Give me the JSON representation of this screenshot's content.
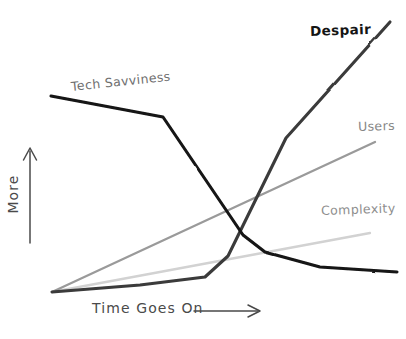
{
  "chart_data": {
    "type": "line",
    "title": "",
    "subtitle": "",
    "xlabel": "Time Goes On ⟶",
    "ylabel": "More ⟶",
    "xlabel_text": "Time Goes On",
    "ylabel_text": "More",
    "xlim": [
      0,
      100
    ],
    "ylim": [
      0,
      100
    ],
    "grid": false,
    "axis_ticks": [],
    "legend_position": "inline-end-of-line",
    "style": "hand-drawn sketch",
    "annotations": [],
    "series": [
      {
        "name": "Tech Savviness",
        "label": "Tech Savviness",
        "color": "#141414",
        "width": 3.1,
        "label_x": 71,
        "label_y": 79,
        "points": [
          [
            0,
            79
          ],
          [
            33,
            70
          ],
          [
            56,
            31
          ],
          [
            62,
            19
          ],
          [
            79,
            11
          ],
          [
            100,
            9
          ]
        ],
        "pixel_points": [
          [
            51,
            96
          ],
          [
            163,
            117
          ],
          [
            243,
            235
          ],
          [
            265,
            252
          ],
          [
            320,
            267
          ],
          [
            397,
            272
          ]
        ]
      },
      {
        "name": "Despair",
        "label": "Despair",
        "color": "#3a3a3a",
        "width": 3.1,
        "label_x": 310,
        "label_y": 23,
        "points": [
          [
            0,
            0
          ],
          [
            25,
            2
          ],
          [
            45,
            6
          ],
          [
            52,
            16
          ],
          [
            70,
            52
          ],
          [
            100,
            108
          ]
        ],
        "pixel_points": [
          [
            52,
            292
          ],
          [
            140,
            285
          ],
          [
            205,
            277
          ],
          [
            228,
            256
          ],
          [
            286,
            138
          ],
          [
            390,
            22
          ]
        ]
      },
      {
        "name": "Users",
        "label": "Users",
        "color": "#9a9a9a",
        "width": 2.3,
        "label_x": 358,
        "label_y": 119,
        "points": [
          [
            0,
            0
          ],
          [
            100,
            60
          ]
        ],
        "pixel_points": [
          [
            52,
            292
          ],
          [
            375,
            142
          ]
        ]
      },
      {
        "name": "Complexity",
        "label": "Complexity",
        "color": "#d2d2d2",
        "width": 2.3,
        "label_x": 321,
        "label_y": 203,
        "points": [
          [
            0,
            0
          ],
          [
            100,
            24
          ]
        ],
        "pixel_points": [
          [
            52,
            292
          ],
          [
            370,
            233
          ]
        ]
      }
    ],
    "axes": {
      "color": "#262626",
      "y_axis": {
        "x": 50,
        "top": 42,
        "bottom": 293
      },
      "x_axis": {
        "y": 293,
        "left": 50,
        "right": 392
      }
    }
  }
}
